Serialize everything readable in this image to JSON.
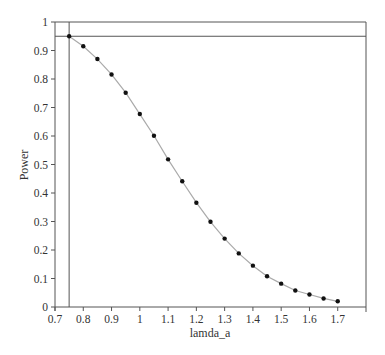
{
  "chart_data": {
    "type": "line",
    "title": "",
    "xlabel": "lamda_a",
    "ylabel": "Power",
    "xlim": [
      0.7,
      1.8
    ],
    "ylim": [
      0,
      1
    ],
    "xticks": [
      0.7,
      0.8,
      0.9,
      1,
      1.1,
      1.2,
      1.3,
      1.4,
      1.5,
      1.6,
      1.7
    ],
    "xtick_labels": [
      "0.7",
      "0.8",
      "0.9",
      "1",
      "1.1",
      "1.2",
      "1.3",
      "1.4",
      "1.5",
      "1.6",
      "1.7"
    ],
    "yticks": [
      0,
      0.1,
      0.2,
      0.3,
      0.4,
      0.5,
      0.6,
      0.7,
      0.8,
      0.9,
      1
    ],
    "ytick_labels": [
      "0",
      "0.1",
      "0.2",
      "0.3",
      "0.4",
      "0.5",
      "0.6",
      "0.7",
      "0.8",
      "0.9",
      "1"
    ],
    "grid": false,
    "legend": null,
    "series": [
      {
        "name": "Power",
        "marker": "dot",
        "line_color": "#aaaaaa",
        "marker_color": "#111111",
        "x": [
          0.75,
          0.8,
          0.85,
          0.9,
          0.95,
          1.0,
          1.05,
          1.1,
          1.15,
          1.2,
          1.25,
          1.3,
          1.35,
          1.4,
          1.45,
          1.5,
          1.55,
          1.6,
          1.65,
          1.7
        ],
        "values": [
          0.95,
          0.915,
          0.87,
          0.816,
          0.752,
          0.677,
          0.601,
          0.518,
          0.441,
          0.366,
          0.299,
          0.24,
          0.188,
          0.145,
          0.108,
          0.082,
          0.058,
          0.044,
          0.03,
          0.02
        ]
      }
    ],
    "reference_lines": [
      {
        "orientation": "horizontal",
        "y": 0.95,
        "color": "#555555"
      },
      {
        "orientation": "vertical",
        "x": 0.75,
        "color": "#555555"
      }
    ]
  },
  "colors": {
    "axis": "#555555",
    "curve": "#aaaaaa",
    "marker": "#111111",
    "text": "#333333"
  }
}
